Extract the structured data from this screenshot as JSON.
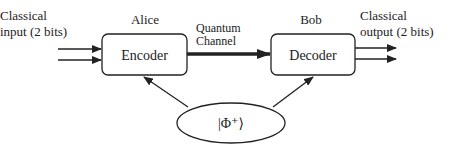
{
  "diagram": {
    "input_label": [
      "Classical",
      "input (2 bits)"
    ],
    "output_label": [
      "Classical",
      "output (2 bits)"
    ],
    "alice": {
      "name": "Alice",
      "box_label": "Encoder"
    },
    "bob": {
      "name": "Bob",
      "box_label": "Decoder"
    },
    "channel_label": [
      "Quantum",
      "Channel"
    ],
    "entangled_state": "|Φ⁺⟩",
    "colors": {
      "stroke": "#222222",
      "background": "#ffffff"
    }
  }
}
